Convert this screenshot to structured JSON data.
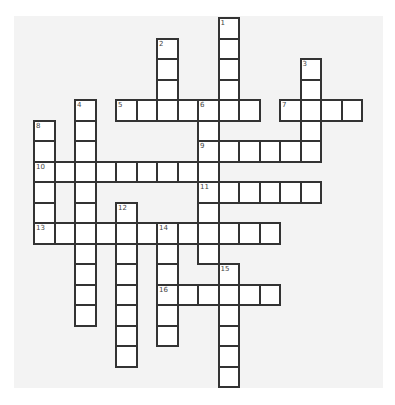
{
  "puzzle": {
    "grid_origin": {
      "x": 34,
      "y": 18
    },
    "cell_size": 20.5,
    "colors": {
      "background": "#f3f3f3",
      "cell": "#ffffff",
      "border": "#333333",
      "number": "#444444"
    },
    "entries": [
      {
        "number": "1",
        "direction": "down",
        "row": 0,
        "col": 9,
        "length": 5
      },
      {
        "number": "2",
        "direction": "down",
        "row": 1,
        "col": 6,
        "length": 4
      },
      {
        "number": "3",
        "direction": "down",
        "row": 2,
        "col": 13,
        "length": 5
      },
      {
        "number": "4",
        "direction": "down",
        "row": 4,
        "col": 2,
        "length": 11
      },
      {
        "number": "5",
        "direction": "across",
        "row": 4,
        "col": 4,
        "length": 7
      },
      {
        "number": "6",
        "direction": "down",
        "row": 4,
        "col": 8,
        "length": 8
      },
      {
        "number": "7",
        "direction": "across",
        "row": 4,
        "col": 12,
        "length": 4
      },
      {
        "number": "8",
        "direction": "down",
        "row": 5,
        "col": 0,
        "length": 6
      },
      {
        "number": "9",
        "direction": "across",
        "row": 6,
        "col": 8,
        "length": 6
      },
      {
        "number": "10",
        "direction": "across",
        "row": 7,
        "col": 0,
        "length": 9
      },
      {
        "number": "11",
        "direction": "across",
        "row": 8,
        "col": 8,
        "length": 6
      },
      {
        "number": "12",
        "direction": "down",
        "row": 9,
        "col": 4,
        "length": 8
      },
      {
        "number": "13",
        "direction": "across",
        "row": 10,
        "col": 0,
        "length": 12
      },
      {
        "number": "14",
        "direction": "down",
        "row": 10,
        "col": 6,
        "length": 6
      },
      {
        "number": "15",
        "direction": "down",
        "row": 12,
        "col": 9,
        "length": 6
      },
      {
        "number": "16",
        "direction": "across",
        "row": 13,
        "col": 6,
        "length": 6
      }
    ]
  }
}
